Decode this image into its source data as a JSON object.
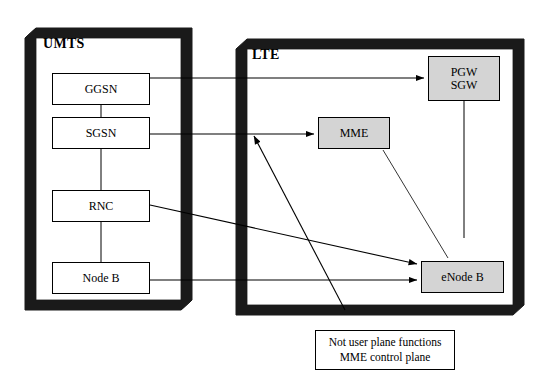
{
  "diagram": {
    "background_color": "#ffffff",
    "line_color": "#000000",
    "frame_color": "#1a1a1a",
    "filled_node_color": "#d4d4d4",
    "plain_node_color": "#ffffff"
  },
  "domains": [
    {
      "id": "umts",
      "label": "UMTS",
      "x": 25,
      "y": 28,
      "w": 167,
      "h": 282,
      "label_x": 43,
      "label_y": 44
    },
    {
      "id": "lte",
      "label": "LTE",
      "x": 236,
      "y": 39,
      "w": 288,
      "h": 276,
      "label_x": 252,
      "label_y": 55
    }
  ],
  "nodes": [
    {
      "id": "ggsn",
      "label": "GGSN",
      "lines": [
        "GGSN"
      ],
      "domain": "umts",
      "fill": "plain",
      "x": 52,
      "y": 73,
      "w": 98,
      "h": 32
    },
    {
      "id": "sgsn",
      "label": "SGSN",
      "lines": [
        "SGSN"
      ],
      "domain": "umts",
      "fill": "plain",
      "x": 52,
      "y": 117,
      "w": 98,
      "h": 32
    },
    {
      "id": "rnc",
      "label": "RNC",
      "lines": [
        "RNC"
      ],
      "domain": "umts",
      "fill": "plain",
      "x": 52,
      "y": 190,
      "w": 98,
      "h": 32
    },
    {
      "id": "nodeb",
      "label": "Node B",
      "lines": [
        "Node B"
      ],
      "domain": "umts",
      "fill": "plain",
      "x": 52,
      "y": 262,
      "w": 98,
      "h": 32
    },
    {
      "id": "pgwsgw",
      "label": "PGW SGW",
      "lines": [
        "PGW",
        "SGW"
      ],
      "domain": "lte",
      "fill": "filled",
      "x": 428,
      "y": 56,
      "w": 72,
      "h": 45
    },
    {
      "id": "mme",
      "label": "MME",
      "lines": [
        "MME"
      ],
      "domain": "lte",
      "fill": "filled",
      "x": 318,
      "y": 117,
      "w": 72,
      "h": 32
    },
    {
      "id": "enodeb",
      "label": "eNode B",
      "lines": [
        "eNode B"
      ],
      "domain": "lte",
      "fill": "filled",
      "x": 421,
      "y": 261,
      "w": 83,
      "h": 32
    }
  ],
  "connections": [
    {
      "id": "ggsn-to-pgwsgw",
      "from": "ggsn",
      "to": "pgwsgw",
      "style": "arrow",
      "weight": 1.1
    },
    {
      "id": "sgsn-to-mme",
      "from": "sgsn",
      "to": "mme",
      "style": "arrow",
      "weight": 1.1
    },
    {
      "id": "rnc-to-enodeb",
      "from": "rnc",
      "to": "enodeb",
      "style": "arrow",
      "weight": 1.1
    },
    {
      "id": "nodeb-to-enodeb",
      "from": "nodeb",
      "to": "enodeb",
      "style": "arrow",
      "weight": 1.1
    },
    {
      "id": "enodeb-to-sgsn-boundary",
      "from": "enodeb-area",
      "to": "lte-left-edge",
      "style": "arrow",
      "weight": 1.1
    },
    {
      "id": "ggsn-sgsn-stem",
      "from": "ggsn",
      "to": "sgsn",
      "style": "plain",
      "weight": 1.0
    },
    {
      "id": "sgsn-rnc-stem",
      "from": "sgsn",
      "to": "rnc",
      "style": "plain",
      "weight": 1.0
    },
    {
      "id": "rnc-nodeb-stem",
      "from": "rnc",
      "to": "nodeb",
      "style": "plain",
      "weight": 1.0
    },
    {
      "id": "pgwsgw-down",
      "from": "pgwsgw",
      "to": "enodeb",
      "style": "plain",
      "weight": 1.0
    },
    {
      "id": "mme-to-note",
      "from": "mme",
      "to": "note",
      "style": "thin",
      "weight": 0.8
    }
  ],
  "note": {
    "id": "note",
    "lines": [
      "Not user plane functions",
      "MME control plane"
    ],
    "x": 315,
    "y": 330,
    "w": 140,
    "h": 40
  }
}
